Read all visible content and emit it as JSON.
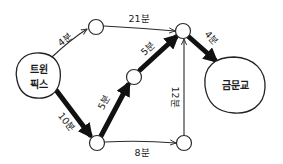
{
  "diagram": {
    "type": "directed-weighted-graph",
    "highlighted_path_note": "thick edges mark shortest route",
    "nodes": {
      "start": {
        "label_line1": "트윈",
        "label_line2": "픽스"
      },
      "end": {
        "label": "금문교"
      },
      "a": {
        "label": ""
      },
      "b": {
        "label": ""
      },
      "c": {
        "label": ""
      },
      "d": {
        "label": ""
      },
      "e": {
        "label": ""
      }
    },
    "edges": {
      "start_a": {
        "from": "트윈픽스",
        "to": "A",
        "label": "4분",
        "minutes": 4,
        "highlighted": false
      },
      "a_b": {
        "from": "A",
        "to": "B",
        "label": "21분",
        "minutes": 21,
        "highlighted": false
      },
      "start_d": {
        "from": "트윈픽스",
        "to": "D",
        "label": "10분",
        "minutes": 10,
        "highlighted": true
      },
      "d_c": {
        "from": "D",
        "to": "C",
        "label": "5분",
        "minutes": 5,
        "highlighted": true
      },
      "c_b": {
        "from": "C",
        "to": "B",
        "label": "5분",
        "minutes": 5,
        "highlighted": true
      },
      "b_end": {
        "from": "B",
        "to": "금문교",
        "label": "4분",
        "minutes": 4,
        "highlighted": true
      },
      "d_e": {
        "from": "D",
        "to": "E",
        "label": "8분",
        "minutes": 8,
        "highlighted": false
      },
      "e_b": {
        "from": "E",
        "to": "B",
        "label": "12분",
        "minutes": 12,
        "highlighted": false
      }
    },
    "colors": {
      "ink": "#111111",
      "background": "#ffffff"
    }
  }
}
